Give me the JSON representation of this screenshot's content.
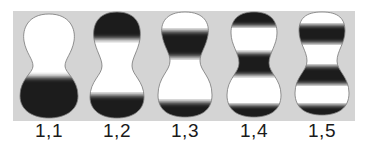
{
  "figure": {
    "background": "#d4d4d4",
    "fill_color": "#ffffff",
    "band_color": "#1e1e1e",
    "modes": [
      {
        "label": "1,1",
        "n": 1,
        "m": 1
      },
      {
        "label": "1,2",
        "n": 1,
        "m": 2
      },
      {
        "label": "1,3",
        "n": 1,
        "m": 3
      },
      {
        "label": "1,4",
        "n": 1,
        "m": 4
      },
      {
        "label": "1,5",
        "n": 1,
        "m": 5
      }
    ]
  }
}
